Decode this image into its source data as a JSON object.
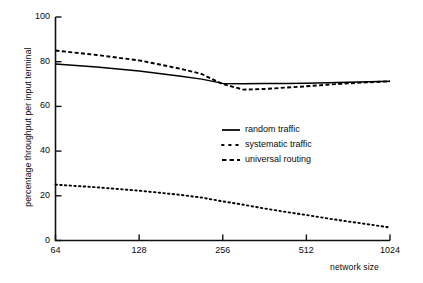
{
  "chart_data": {
    "type": "line",
    "title": "",
    "xlabel": "network size",
    "ylabel": "percentage throughput per input terminal",
    "xscale": "log2",
    "xlim": [
      64,
      1024
    ],
    "ylim": [
      0,
      100
    ],
    "grid": false,
    "x_ticks": [
      "64",
      "128",
      "256",
      "512",
      "1024"
    ],
    "x_tick_values": [
      64,
      128,
      256,
      512,
      1024
    ],
    "y_ticks": [
      "0",
      "20",
      "40",
      "60",
      "80",
      "100"
    ],
    "y_tick_values": [
      0,
      20,
      40,
      60,
      80,
      100
    ],
    "legend_position": "center",
    "x": [
      64,
      90,
      128,
      181,
      215,
      256,
      304,
      362,
      430,
      512,
      608,
      724,
      860,
      1024
    ],
    "series": [
      {
        "name": "random traffic",
        "style": "solid",
        "color": "#000000",
        "values": [
          79.0,
          77.6,
          75.8,
          73.5,
          72.2,
          70.3,
          70.1,
          70.2,
          70.3,
          70.4,
          70.6,
          70.8,
          71.0,
          71.2
        ]
      },
      {
        "name": "systematic traffic",
        "style": "dotted",
        "color": "#000000",
        "values": [
          25.0,
          23.8,
          22.3,
          20.4,
          19.2,
          17.5,
          16.0,
          14.3,
          12.8,
          11.4,
          9.9,
          8.5,
          7.2,
          5.8
        ]
      },
      {
        "name": "universal routing",
        "style": "dashed",
        "color": "#000000",
        "values": [
          85.0,
          83.0,
          80.6,
          76.8,
          74.5,
          70.0,
          67.5,
          67.8,
          68.4,
          69.0,
          69.7,
          70.3,
          70.8,
          71.2
        ]
      }
    ]
  },
  "axes": {
    "x_axis_title": "network size",
    "y_axis_title": "percentage throughput per input terminal"
  },
  "legend": {
    "items": [
      {
        "label": "random traffic",
        "style": "solid"
      },
      {
        "label": "systematic traffic",
        "style": "dotted"
      },
      {
        "label": "universal routing",
        "style": "dashed"
      }
    ]
  },
  "ticks": {
    "y": [
      "100",
      "80",
      "60",
      "40",
      "20",
      "0"
    ],
    "x": [
      "64",
      "128",
      "256",
      "512",
      "1024"
    ]
  }
}
